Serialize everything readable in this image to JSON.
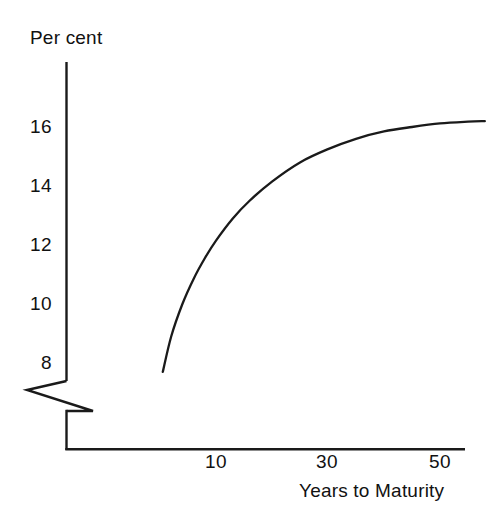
{
  "figure": {
    "name": "yield-curve-figure",
    "background_color": "#ffffff",
    "line_color": "#1a1a1a"
  },
  "chart_data": {
    "type": "line",
    "title": "",
    "subtitle": "",
    "xlabel": "Years to Maturity",
    "ylabel": "Per cent",
    "x": [
      0.5,
      2,
      4,
      6,
      8,
      10,
      13,
      16,
      20,
      25,
      30,
      35,
      40,
      45,
      50,
      55,
      58
    ],
    "y": [
      7.7,
      8.9,
      10.0,
      10.85,
      11.55,
      12.15,
      12.9,
      13.5,
      14.15,
      14.8,
      15.25,
      15.6,
      15.85,
      16.0,
      16.12,
      16.18,
      16.2
    ],
    "series": [
      {
        "name": "Yield curve",
        "values": [
          7.7,
          8.9,
          10.0,
          10.85,
          11.55,
          12.15,
          12.9,
          13.5,
          14.15,
          14.8,
          15.25,
          15.6,
          15.85,
          16.0,
          16.12,
          16.18,
          16.2
        ]
      }
    ],
    "xlim": [
      0,
      58
    ],
    "ylim": [
      7.4,
      16.6
    ],
    "y_axis_broken": true,
    "grid": false,
    "legend": false,
    "legend_position": "none",
    "xticks": [
      {
        "value": 10,
        "label": "10"
      },
      {
        "value": 30,
        "label": "30"
      },
      {
        "value": 50,
        "label": "50"
      }
    ],
    "yticks": [
      {
        "value": 16,
        "label": "16"
      },
      {
        "value": 14,
        "label": "14"
      },
      {
        "value": 12,
        "label": "12"
      },
      {
        "value": 10,
        "label": "10"
      },
      {
        "value": 8,
        "label": "8"
      }
    ],
    "annotations": []
  },
  "axes": {
    "y_title": "Per cent",
    "x_title": "Years to Maturity",
    "y_tick_labels": [
      "16",
      "14",
      "12",
      "10",
      "8"
    ],
    "x_tick_labels": [
      "10",
      "30",
      "50"
    ]
  }
}
